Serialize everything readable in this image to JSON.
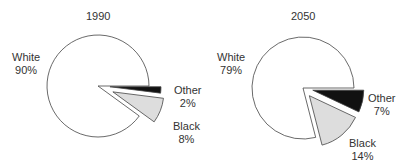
{
  "chart_data": [
    {
      "type": "pie",
      "title": "1990",
      "categories": [
        "White",
        "Other",
        "Black"
      ],
      "values": [
        90,
        2,
        8
      ],
      "labels": [
        "White\n90%",
        "Other\n2%",
        "Black\n8%"
      ],
      "colors": [
        "#ffffff",
        "#111111",
        "#dddddd"
      ],
      "exploded": [
        "Other",
        "Black"
      ]
    },
    {
      "type": "pie",
      "title": "2050",
      "categories": [
        "White",
        "Other",
        "Black"
      ],
      "values": [
        79,
        7,
        14
      ],
      "labels": [
        "White\n79%",
        "Other\n7%",
        "Black\n14%"
      ],
      "colors": [
        "#ffffff",
        "#111111",
        "#dddddd"
      ],
      "exploded": [
        "Other",
        "Black"
      ]
    }
  ],
  "charts": [
    {
      "title": "1990",
      "white": {
        "name": "White",
        "pct": "90%"
      },
      "other": {
        "name": "Other",
        "pct": "2%"
      },
      "black": {
        "name": "Black",
        "pct": "8%"
      }
    },
    {
      "title": "2050",
      "white": {
        "name": "White",
        "pct": "79%"
      },
      "other": {
        "name": "Other",
        "pct": "7%"
      },
      "black": {
        "name": "Black",
        "pct": "14%"
      }
    }
  ]
}
